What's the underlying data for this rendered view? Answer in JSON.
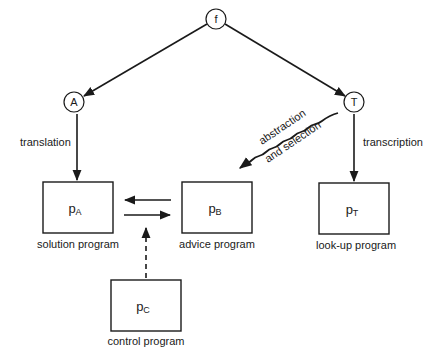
{
  "nodes": {
    "f": {
      "label": "f"
    },
    "A": {
      "label": "A"
    },
    "T": {
      "label": "T"
    }
  },
  "programs": {
    "pA": {
      "symbol": "p",
      "subscript": "A",
      "caption": "solution program"
    },
    "pB": {
      "symbol": "p",
      "subscript": "B",
      "caption": "advice program"
    },
    "pT": {
      "symbol": "p",
      "subscript": "T",
      "caption": "look-up program"
    },
    "pC": {
      "symbol": "p",
      "subscript": "C",
      "caption": "control program"
    }
  },
  "edges": {
    "translation": "translation",
    "transcription": "transcription",
    "abstraction_line1": "abstraction",
    "abstraction_line2": "and selection"
  },
  "colors": {
    "stroke": "#1a1a1a",
    "background": "#ffffff"
  }
}
